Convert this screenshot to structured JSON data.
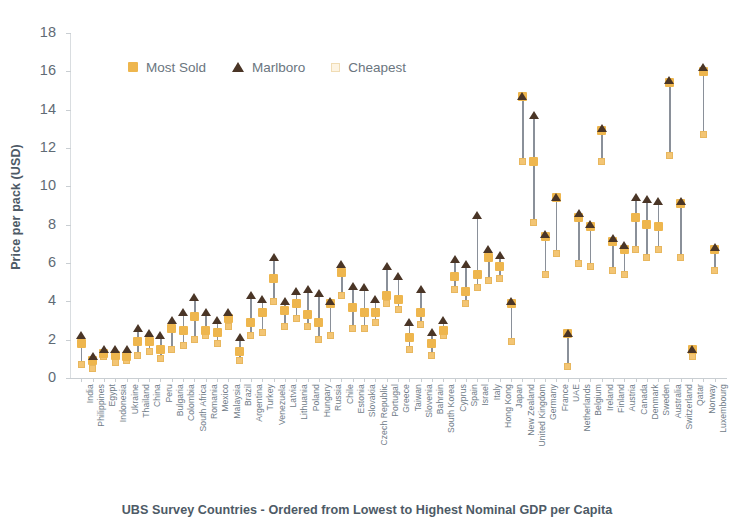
{
  "chart_data": {
    "type": "scatter",
    "title": "",
    "xlabel": "UBS Survey Countries - Ordered from Lowest to Highest Nominal GDP per Capita",
    "ylabel": "Price per pack (USD)",
    "ylim": [
      0,
      18
    ],
    "ytick_labels": [
      "18",
      "16",
      "14",
      "12",
      "10",
      "8",
      "6",
      "4",
      "2",
      "0"
    ],
    "yticks": [
      18,
      16,
      14,
      12,
      10,
      8,
      6,
      4,
      2,
      0
    ],
    "grid": false,
    "legend_position": "top-left",
    "legend": [
      {
        "label": "Most Sold",
        "marker": "square",
        "color": "#eeb64e"
      },
      {
        "label": "Marlboro",
        "marker": "triangle",
        "color": "#4a3526"
      },
      {
        "label": "Cheapest",
        "marker": "open-square",
        "color": "#f3c574"
      }
    ],
    "categories": [
      "India",
      "Philippines",
      "Egypt",
      "Indonesia",
      "Ukraine",
      "Thailand",
      "China",
      "Peru",
      "Bulgaria",
      "Colombia",
      "South Africa",
      "Romania",
      "Mexico",
      "Malaysia",
      "Brazil",
      "Argentina",
      "Turkey",
      "Venezuela",
      "Latvia",
      "Lithuania",
      "Poland",
      "Hungary",
      "Russia",
      "Chile",
      "Estonia",
      "Slovakia",
      "Czech Republic",
      "Portugal",
      "Greece",
      "Taiwan",
      "Slovenia",
      "Bahrain",
      "South Korea",
      "Cyprus",
      "Spain",
      "Israel",
      "Italy",
      "Hong Kong",
      "Japan",
      "New Zealand",
      "United Kingdom",
      "Germany",
      "France",
      "UAE",
      "Netherlands",
      "Belgium",
      "Ireland",
      "Finland",
      "Austria",
      "Canada",
      "Denmark",
      "Sweden",
      "Australia",
      "Switzerland",
      "Qatar",
      "Norway",
      "Luxembourg"
    ],
    "series": [
      {
        "name": "Most Sold",
        "values": [
          1.8,
          0.9,
          1.3,
          1.2,
          1.1,
          1.9,
          1.9,
          1.5,
          2.6,
          2.5,
          3.2,
          2.5,
          2.4,
          3.1,
          1.4,
          2.9,
          3.4,
          5.2,
          3.5,
          3.9,
          3.3,
          2.9,
          3.9,
          5.5,
          3.7,
          3.4,
          3.4,
          4.3,
          4.1,
          2.1,
          3.4,
          1.8,
          2.5,
          5.3,
          4.5,
          5.4,
          6.3,
          5.8,
          3.9,
          14.7,
          11.3,
          7.4,
          9.4,
          2.3,
          8.4,
          7.9,
          12.9,
          7.1,
          6.7,
          8.4,
          8.0,
          7.9,
          15.4,
          9.1,
          1.5,
          16.0,
          6.7
        ]
      },
      {
        "name": "Marlboro",
        "values": [
          2.2,
          1.1,
          1.5,
          1.5,
          1.5,
          2.6,
          2.3,
          2.2,
          3.0,
          3.4,
          4.2,
          3.4,
          3.0,
          3.4,
          2.1,
          4.3,
          4.1,
          6.3,
          4.0,
          4.5,
          4.6,
          4.4,
          4.0,
          5.9,
          4.8,
          4.7,
          4.1,
          5.8,
          5.3,
          2.9,
          4.6,
          2.4,
          3.0,
          6.2,
          5.9,
          8.5,
          6.7,
          6.4,
          4.0,
          14.7,
          13.7,
          7.5,
          9.4,
          2.3,
          8.6,
          8.0,
          13.0,
          7.3,
          6.9,
          9.4,
          9.3,
          9.2,
          15.5,
          9.2,
          1.5,
          16.2,
          6.8
        ]
      },
      {
        "name": "Cheapest",
        "values": [
          0.7,
          0.5,
          1.1,
          0.8,
          0.9,
          1.2,
          1.4,
          1.0,
          1.5,
          1.7,
          2.0,
          2.2,
          1.8,
          2.7,
          0.9,
          2.2,
          2.4,
          4.0,
          2.7,
          3.1,
          2.7,
          2.0,
          2.2,
          4.3,
          2.6,
          2.6,
          2.9,
          3.9,
          3.6,
          1.5,
          2.8,
          1.2,
          2.2,
          4.6,
          3.9,
          4.7,
          5.1,
          5.2,
          1.9,
          11.3,
          8.1,
          5.4,
          6.5,
          0.6,
          6.0,
          5.8,
          11.3,
          5.6,
          5.4,
          6.7,
          6.3,
          6.7,
          11.6,
          6.3,
          1.1,
          12.7,
          5.6
        ]
      }
    ]
  }
}
